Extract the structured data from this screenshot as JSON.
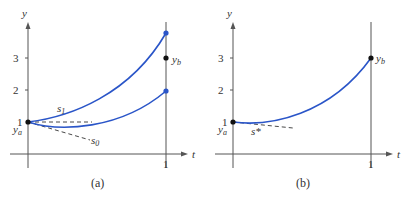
{
  "panels": [
    {
      "caption": "(a)",
      "y_label": "y",
      "t_label": "t",
      "y_ticks": [
        "1",
        "2",
        "3"
      ],
      "t_ticks": [
        "1"
      ],
      "ya_label": "y",
      "ya_sub": "a",
      "yb_label": "y",
      "yb_sub": "b",
      "curves": [
        {
          "name": "s1",
          "label": "s",
          "sub": "1",
          "start": 1.0,
          "end": 3.75
        },
        {
          "name": "s0",
          "label": "s",
          "sub": "0",
          "start": 1.0,
          "end": 1.95
        }
      ],
      "target_yb": 3.0,
      "curve_color": "#2a55c8"
    },
    {
      "caption": "(b)",
      "y_label": "y",
      "t_label": "t",
      "y_ticks": [
        "1",
        "2",
        "3"
      ],
      "t_ticks": [
        "1"
      ],
      "ya_label": "y",
      "ya_sub": "a",
      "yb_label": "y",
      "yb_sub": "b",
      "curves": [
        {
          "name": "s-star",
          "label": "s*",
          "start": 1.0,
          "end": 3.0
        }
      ],
      "target_yb": 3.0,
      "curve_color": "#2a55c8"
    }
  ]
}
